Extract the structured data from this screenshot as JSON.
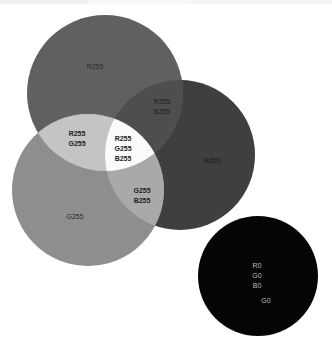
{
  "diagram": {
    "type": "rgb-additive-venn",
    "circles": [
      {
        "id": "red",
        "label": "R255",
        "color": "#606060"
      },
      {
        "id": "green",
        "label": "G255",
        "color": "#8e8e8e"
      },
      {
        "id": "blue",
        "label": "B255",
        "color": "#3f3f3f"
      },
      {
        "id": "black",
        "labels": [
          "R0",
          "G0",
          "B0"
        ],
        "extra_label": "G0",
        "color": "#050505"
      }
    ],
    "intersections": {
      "red_green": [
        "R255",
        "G255"
      ],
      "red_blue": [
        "R255",
        "B255"
      ],
      "green_blue": [
        "G255",
        "B255"
      ],
      "red_green_blue": [
        "R255",
        "G255",
        "B255"
      ]
    },
    "colors": {
      "red_green": "#c4c4c4",
      "red_blue": "#4e4e4e",
      "green_blue": "#a9a9a9",
      "center": "#fbfbfb",
      "background": "#ffffff"
    }
  }
}
